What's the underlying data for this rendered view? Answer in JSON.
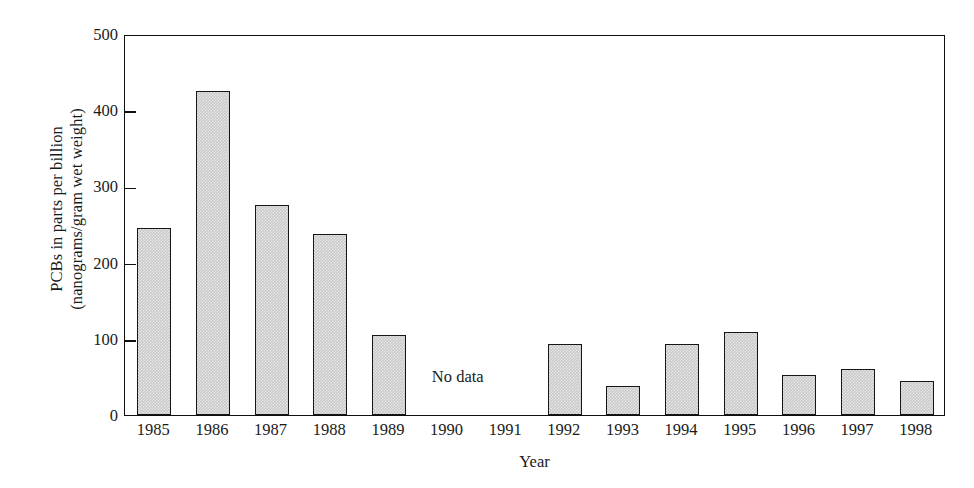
{
  "chart_data": {
    "type": "bar",
    "title": "",
    "subtitle": "",
    "xlabel": "Year",
    "ylabel_line1": "PCBs in parts per billion",
    "ylabel_line2": "(nanograms/gram wet weight)",
    "ylabel": "PCBs in parts per billion (nanograms/gram wet weight)",
    "categories": [
      "1985",
      "1986",
      "1987",
      "1988",
      "1989",
      "1990",
      "1991",
      "1992",
      "1993",
      "1994",
      "1995",
      "1996",
      "1997",
      "1998"
    ],
    "values": [
      245,
      425,
      275,
      237,
      105,
      null,
      null,
      93,
      38,
      93,
      109,
      53,
      61,
      45
    ],
    "ylim": [
      0,
      500
    ],
    "yticks": [
      "0",
      "100",
      "200",
      "300",
      "400",
      "500"
    ],
    "ytick_values": [
      0,
      100,
      200,
      300,
      400,
      500
    ],
    "grid": false,
    "legend": "none",
    "annotations": [
      {
        "text": "No data",
        "covers": [
          "1990",
          "1991"
        ]
      }
    ],
    "bar_fill_color": "#c9c9c9",
    "bar_edge_color": "#161616",
    "axis_color": "#101010",
    "background_color": "#ffffff"
  }
}
